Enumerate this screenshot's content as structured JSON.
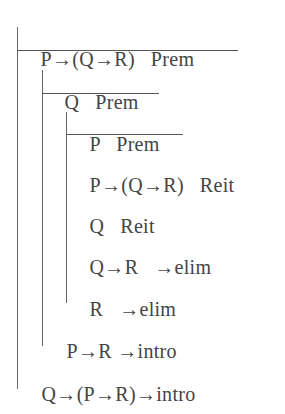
{
  "proof": {
    "lines": [
      {
        "formula": "P→(Q→R)",
        "justification": "Prem"
      },
      {
        "formula": "Q",
        "justification": "Prem"
      },
      {
        "formula": "P",
        "justification": "Prem"
      },
      {
        "formula": "P→(Q→R)",
        "justification": "Reit"
      },
      {
        "formula": "Q",
        "justification": "Reit"
      },
      {
        "formula": "Q→R",
        "justification": "→elim"
      },
      {
        "formula": "R",
        "justification": "→elim"
      },
      {
        "formula": "P→R",
        "justification": "→intro"
      },
      {
        "formula": "Q→(P→R)",
        "justification": "→intro"
      }
    ]
  }
}
